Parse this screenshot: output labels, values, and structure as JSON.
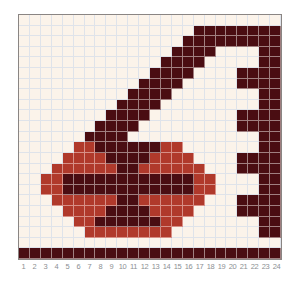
{
  "chart_data": {
    "type": "heatmap",
    "title": "",
    "columns": 24,
    "rows": 23,
    "column_labels": [
      "1",
      "2",
      "3",
      "4",
      "5",
      "6",
      "7",
      "8",
      "9",
      "10",
      "11",
      "12",
      "13",
      "14",
      "15",
      "16",
      "17",
      "18",
      "19",
      "20",
      "21",
      "22",
      "23",
      "24"
    ],
    "legend": {
      "background": {
        "color": "#fbf3ea",
        "label": "background"
      },
      "D": {
        "color": "#4a0d12",
        "label": "dark maroon"
      },
      "R": {
        "color": "#b0392b",
        "label": "brick red"
      }
    },
    "grid_rows": [
      "........................",
      "................DDDDDDDD",
      "...............DDDDDDDDD",
      "..............DDDD....DD",
      ".............DDDD.....DD",
      "............DDDD....DDDD",
      "...........DDDD.....DDDD",
      "..........DDDD........DD",
      ".........DDDD.........DD",
      "........DDDD........DDDD",
      ".......DDDD.........DDDD",
      "......DDDD............DD",
      ".....RRDDDDDDRR.......DD",
      "....RRRRDDDDRRRR....DDDD",
      "...RRRRRRDDRRRRRR...DDDD",
      "..RRDDDDDDDDDDDDRR....DD",
      "..RRDDDDDDDDDDDDRR....DD",
      "...RRRRRRDDRRRRRR...DDDD",
      "....RRRRDDDDRRRR....DDDD",
      ".....RRDDDDDDRR.......DD",
      "......RRRRRRRR........DD",
      "........................",
      "DDDDDDDDDDDDDDDDDDDDDDDD"
    ]
  },
  "colors": {
    "dark": "#4a0d12",
    "red": "#b0392b",
    "background": "#fbf3ea",
    "gridline": "#dfe3ea",
    "label": "#8c8f93"
  }
}
